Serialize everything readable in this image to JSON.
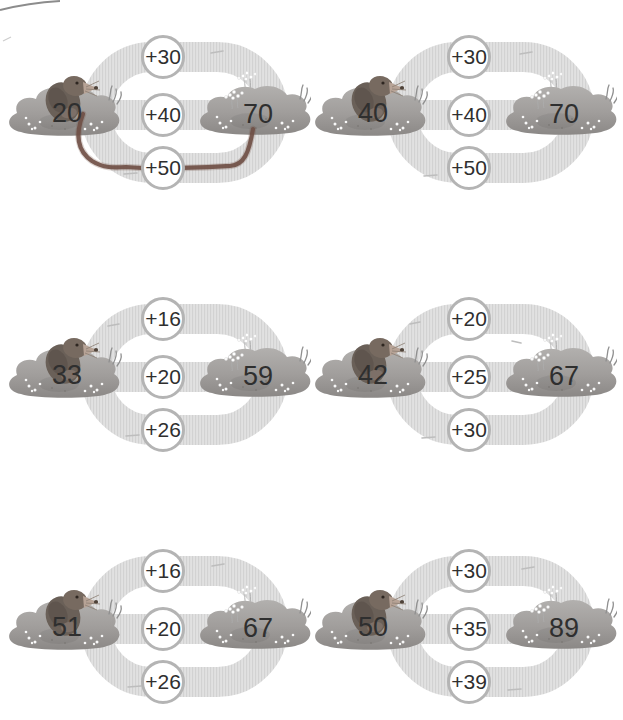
{
  "worksheet": {
    "theme": "mole-path addition puzzles",
    "grid": "2 columns x 3 rows"
  },
  "colors": {
    "page-bg": "#ffffff",
    "track-base": "#e1e1e1",
    "track-stripe": "#d2d2d2",
    "circle-fill": "#ffffff",
    "circle-border": "#b4b4b4",
    "digits": "#2f2f2f",
    "mound-light": "#b2b0ae",
    "mound-dark": "#8b8886",
    "mole-body": "#6a6058",
    "mole-head": "#776a60",
    "mole-snout": "#b7a396",
    "answer-line": "#6f4f45"
  },
  "puzzles": [
    {
      "start": "20",
      "end": "70",
      "operations": [
        "+30",
        "+40",
        "+50"
      ],
      "drawn_answer": "+50"
    },
    {
      "start": "40",
      "end": "70",
      "operations": [
        "+30",
        "+40",
        "+50"
      ]
    },
    {
      "start": "33",
      "end": "59",
      "operations": [
        "+16",
        "+20",
        "+26"
      ]
    },
    {
      "start": "42",
      "end": "67",
      "operations": [
        "+20",
        "+25",
        "+30"
      ]
    },
    {
      "start": "51",
      "end": "67",
      "operations": [
        "+16",
        "+20",
        "+26"
      ]
    },
    {
      "start": "50",
      "end": "89",
      "operations": [
        "+30",
        "+35",
        "+39"
      ]
    }
  ]
}
